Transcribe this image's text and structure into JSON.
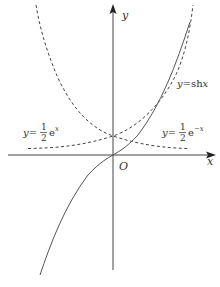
{
  "diagram": {
    "type": "function-graph",
    "axes": {
      "x_label": "x",
      "y_label": "y",
      "origin_label": "O"
    },
    "curves": [
      {
        "name": "half-exp-pos",
        "label_prefix": "y=",
        "label_frac_num": "1",
        "label_frac_den": "2",
        "label_func": "e",
        "label_exp": "x",
        "style": "dashed"
      },
      {
        "name": "half-exp-neg",
        "label_prefix": "y=",
        "label_frac_num": "1",
        "label_frac_den": "2",
        "label_func": "e",
        "label_exp": "−x",
        "style": "dashed"
      },
      {
        "name": "sinh",
        "label_prefix": "y=",
        "label_func": "sh",
        "label_var": "x",
        "style": "solid"
      }
    ],
    "colors": {
      "axis": "#444444",
      "curve": "#555555"
    }
  }
}
